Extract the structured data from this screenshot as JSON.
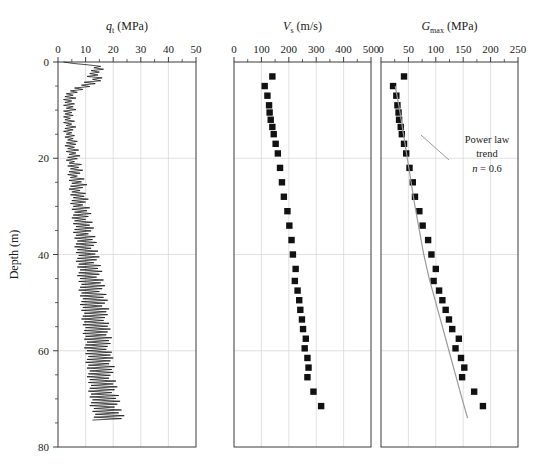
{
  "figure": {
    "ylabel": "Depth (m)",
    "y_ticks": [
      0,
      20,
      40,
      60,
      80
    ],
    "y_minor_step": 5,
    "ylim": [
      0,
      80
    ],
    "background": "#ffffff",
    "grid_color": "#d9d9d9",
    "axis_color": "#3a3a3a",
    "marker_color": "#111111",
    "trend_color": "#9a9a9a"
  },
  "chart_data": [
    {
      "type": "line",
      "panel": 1,
      "title": "q_t (MPa)",
      "title_main": "q",
      "title_sub": "t",
      "title_units": "(MPa)",
      "xlabel": "q_t (MPa)",
      "ylabel": "Depth (m)",
      "xlim": [
        0,
        50
      ],
      "ylim": [
        0,
        80
      ],
      "x_ticks": [
        0,
        10,
        20,
        30,
        40,
        50
      ],
      "x_minor_step": 5,
      "grid": true,
      "legend": "none",
      "series": [
        {
          "name": "Cone tip resistance qt",
          "comment": "depth (m) vs qt (MPa), densely sampled CPT trace",
          "depth": [
            0.0,
            0.3,
            0.6,
            0.9,
            1.2,
            1.5,
            1.8,
            2.1,
            2.4,
            2.7,
            3.0,
            3.3,
            3.6,
            3.9,
            4.2,
            4.5,
            4.8,
            5.1,
            5.4,
            5.7,
            6.0,
            6.3,
            6.6,
            6.9,
            7.2,
            7.5,
            7.8,
            8.1,
            8.4,
            8.7,
            9.0,
            9.3,
            9.6,
            9.9,
            10.2,
            10.5,
            10.8,
            11.1,
            11.4,
            11.7,
            12.0,
            12.3,
            12.6,
            12.9,
            13.2,
            13.5,
            13.8,
            14.1,
            14.4,
            14.7,
            15.0,
            15.3,
            15.6,
            15.9,
            16.2,
            16.5,
            16.8,
            17.1,
            17.4,
            17.7,
            18.0,
            18.3,
            18.6,
            18.9,
            19.2,
            19.5,
            19.8,
            20.1,
            20.4,
            20.7,
            21.0,
            21.3,
            21.6,
            21.9,
            22.2,
            22.5,
            22.8,
            23.1,
            23.4,
            23.7,
            24.0,
            24.3,
            24.6,
            24.9,
            25.2,
            25.5,
            25.8,
            26.1,
            26.4,
            26.7,
            27.0,
            27.3,
            27.6,
            27.9,
            28.2,
            28.5,
            28.8,
            29.1,
            29.4,
            29.7,
            30.0,
            30.3,
            30.6,
            30.9,
            31.2,
            31.5,
            31.8,
            32.1,
            32.4,
            32.7,
            33.0,
            33.3,
            33.6,
            33.9,
            34.2,
            34.5,
            34.8,
            35.1,
            35.4,
            35.7,
            36.0,
            36.3,
            36.6,
            36.9,
            37.2,
            37.5,
            37.8,
            38.1,
            38.4,
            38.7,
            39.0,
            39.3,
            39.6,
            39.9,
            40.2,
            40.5,
            40.8,
            41.1,
            41.4,
            41.7,
            42.0,
            42.3,
            42.6,
            42.9,
            43.2,
            43.5,
            43.8,
            44.1,
            44.4,
            44.7,
            45.0,
            45.3,
            45.6,
            45.9,
            46.2,
            46.5,
            46.8,
            47.1,
            47.4,
            47.7,
            48.0,
            48.3,
            48.6,
            48.9,
            49.2,
            49.5,
            49.8,
            50.1,
            50.4,
            50.7,
            51.0,
            51.3,
            51.6,
            51.9,
            52.2,
            52.5,
            52.8,
            53.1,
            53.4,
            53.7,
            54.0,
            54.3,
            54.6,
            54.9,
            55.2,
            55.5,
            55.8,
            56.1,
            56.4,
            56.7,
            57.0,
            57.3,
            57.6,
            57.9,
            58.2,
            58.5,
            58.8,
            59.1,
            59.4,
            59.7,
            60.0,
            60.3,
            60.6,
            60.9,
            61.2,
            61.5,
            61.8,
            62.1,
            62.4,
            62.7,
            63.0,
            63.3,
            63.6,
            63.9,
            64.2,
            64.5,
            64.8,
            65.1,
            65.4,
            65.7,
            66.0,
            66.3,
            66.6,
            66.9,
            67.2,
            67.5,
            67.8,
            68.1,
            68.4,
            68.7,
            69.0,
            69.3,
            69.6,
            69.9,
            70.2,
            70.5,
            70.8,
            71.1,
            71.4,
            71.7,
            72.0,
            72.3,
            72.6,
            72.9,
            73.2,
            73.5,
            73.8,
            74.1,
            74.4
          ],
          "qt": [
            2.0,
            5.5,
            11.0,
            15.5,
            13.0,
            16.5,
            12.0,
            15.0,
            11.5,
            14.5,
            10.5,
            16.0,
            12.5,
            15.5,
            9.5,
            13.5,
            8.5,
            11.5,
            6.0,
            9.0,
            4.5,
            7.0,
            3.0,
            5.5,
            2.5,
            6.5,
            2.0,
            5.0,
            2.5,
            6.0,
            2.0,
            5.5,
            3.0,
            6.5,
            2.0,
            5.0,
            2.5,
            5.5,
            2.0,
            4.5,
            2.5,
            6.0,
            2.0,
            5.0,
            3.0,
            6.5,
            2.5,
            5.5,
            2.0,
            5.0,
            3.0,
            6.0,
            2.5,
            5.5,
            3.5,
            7.0,
            3.0,
            6.5,
            2.5,
            6.0,
            3.5,
            7.5,
            3.0,
            6.5,
            4.0,
            8.0,
            3.5,
            7.0,
            3.0,
            6.0,
            4.0,
            8.5,
            3.5,
            7.5,
            4.5,
            9.0,
            4.0,
            8.0,
            3.5,
            7.0,
            4.5,
            9.5,
            4.0,
            8.5,
            5.0,
            10.5,
            4.5,
            9.0,
            4.0,
            8.0,
            5.0,
            10.0,
            4.5,
            9.5,
            5.5,
            11.0,
            5.0,
            10.0,
            4.5,
            9.0,
            5.5,
            11.5,
            5.0,
            10.5,
            6.0,
            12.0,
            5.5,
            11.0,
            5.0,
            10.0,
            6.0,
            12.5,
            5.5,
            11.5,
            6.5,
            13.0,
            6.0,
            12.0,
            5.5,
            11.0,
            6.5,
            13.5,
            6.0,
            12.5,
            7.0,
            14.0,
            6.5,
            13.0,
            6.0,
            12.0,
            7.0,
            14.5,
            6.5,
            13.5,
            7.5,
            15.0,
            7.0,
            14.0,
            6.5,
            13.0,
            7.5,
            15.5,
            7.0,
            14.5,
            8.0,
            16.0,
            7.5,
            15.0,
            7.0,
            14.0,
            8.0,
            16.5,
            7.5,
            15.5,
            8.5,
            17.0,
            8.0,
            16.0,
            7.5,
            15.0,
            8.5,
            17.5,
            8.0,
            16.5,
            9.0,
            18.0,
            8.5,
            17.0,
            8.0,
            16.0,
            9.0,
            18.5,
            8.5,
            17.5,
            9.5,
            18.0,
            9.0,
            17.0,
            8.5,
            16.5,
            9.5,
            18.5,
            9.0,
            18.0,
            10.0,
            19.0,
            9.5,
            18.0,
            9.0,
            17.5,
            10.0,
            19.5,
            9.5,
            18.5,
            10.5,
            19.0,
            10.0,
            18.0,
            9.5,
            17.5,
            10.5,
            19.5,
            10.0,
            19.0,
            11.0,
            20.0,
            10.5,
            19.0,
            10.0,
            18.5,
            11.0,
            20.5,
            10.5,
            19.5,
            11.5,
            20.0,
            11.0,
            19.0,
            10.5,
            18.5,
            11.5,
            21.0,
            11.0,
            20.0,
            12.0,
            21.5,
            11.5,
            20.5,
            11.0,
            19.5,
            12.0,
            22.0,
            11.5,
            21.0,
            12.5,
            22.5,
            12.0,
            21.5,
            11.5,
            20.5,
            13.0,
            23.0,
            12.5,
            22.0,
            13.5,
            24.0,
            13.0,
            23.0,
            12.5,
            22.5,
            14.0,
            25.0
          ]
        }
      ]
    },
    {
      "type": "scatter",
      "panel": 2,
      "title": "V_s (m/s)",
      "title_main": "V",
      "title_sub": "s",
      "title_units": "(m/s)",
      "xlabel": "V_s (m/s)",
      "ylabel": "Depth (m)",
      "xlim": [
        0,
        500
      ],
      "ylim": [
        0,
        80
      ],
      "x_ticks": [
        0,
        100,
        200,
        300,
        400,
        500
      ],
      "x_minor_step": 50,
      "grid": true,
      "marker": "square",
      "legend": "none",
      "series": [
        {
          "name": "Shear wave velocity Vs",
          "comment": "depth (m) vs Vs (m/s), discrete seismic CPT intervals",
          "points": [
            [
              3.0,
              140
            ],
            [
              5.0,
              112
            ],
            [
              7.0,
              122
            ],
            [
              9.0,
              128
            ],
            [
              10.5,
              130
            ],
            [
              12.0,
              134
            ],
            [
              13.5,
              140
            ],
            [
              15.0,
              145
            ],
            [
              17.0,
              152
            ],
            [
              19.0,
              160
            ],
            [
              22.0,
              168
            ],
            [
              25.0,
              175
            ],
            [
              28.0,
              182
            ],
            [
              31.0,
              195
            ],
            [
              34.0,
              202
            ],
            [
              37.0,
              210
            ],
            [
              40.0,
              215
            ],
            [
              43.0,
              225
            ],
            [
              45.5,
              222
            ],
            [
              47.5,
              232
            ],
            [
              49.5,
              238
            ],
            [
              51.5,
              242
            ],
            [
              53.5,
              248
            ],
            [
              55.5,
              252
            ],
            [
              57.5,
              262
            ],
            [
              59.5,
              258
            ],
            [
              61.5,
              268
            ],
            [
              63.5,
              272
            ],
            [
              65.5,
              268
            ],
            [
              68.5,
              290
            ],
            [
              71.5,
              318
            ]
          ]
        }
      ]
    },
    {
      "type": "scatter",
      "panel": 3,
      "title": "G_max (MPa)",
      "title_main": "G",
      "title_sub": "max",
      "title_units": "(MPa)",
      "xlabel": "G_max (MPa)",
      "ylabel": "Depth (m)",
      "xlim": [
        0,
        250
      ],
      "ylim": [
        0,
        80
      ],
      "x_ticks": [
        0,
        50,
        100,
        150,
        200,
        250
      ],
      "x_minor_step": 25,
      "grid": true,
      "marker": "square",
      "legend": "none",
      "annotation": {
        "line1": "Power law",
        "line2": "trend",
        "line3_var": "n",
        "line3_val": "= 0.6",
        "exponent": 0.6
      },
      "series": [
        {
          "name": "Small-strain shear modulus Gmax",
          "comment": "depth (m) vs Gmax (MPa), square markers",
          "points": [
            [
              3.0,
              42
            ],
            [
              5.0,
              22
            ],
            [
              7.0,
              28
            ],
            [
              9.0,
              30
            ],
            [
              10.5,
              32
            ],
            [
              12.0,
              33
            ],
            [
              13.5,
              36
            ],
            [
              15.0,
              38
            ],
            [
              17.0,
              42
            ],
            [
              19.0,
              46
            ],
            [
              22.0,
              52
            ],
            [
              25.0,
              58
            ],
            [
              28.0,
              62
            ],
            [
              31.0,
              70
            ],
            [
              34.0,
              76
            ],
            [
              37.0,
              86
            ],
            [
              40.0,
              92
            ],
            [
              43.0,
              100
            ],
            [
              45.5,
              96
            ],
            [
              47.5,
              106
            ],
            [
              49.5,
              112
            ],
            [
              51.5,
              118
            ],
            [
              53.5,
              124
            ],
            [
              55.5,
              130
            ],
            [
              57.5,
              142
            ],
            [
              59.5,
              136
            ],
            [
              61.5,
              146
            ],
            [
              63.5,
              152
            ],
            [
              65.5,
              148
            ],
            [
              68.5,
              170
            ],
            [
              71.5,
              186
            ]
          ]
        },
        {
          "name": "Power law trend line",
          "comment": "Gmax = A * z^0.6 reference trend, depth-Gmax pairs",
          "trend": [
            [
              5.0,
              26
            ],
            [
              10.0,
              34
            ],
            [
              15.0,
              41
            ],
            [
              20.0,
              48
            ],
            [
              25.0,
              55
            ],
            [
              30.0,
              62
            ],
            [
              35.0,
              70
            ],
            [
              40.0,
              78
            ],
            [
              45.0,
              88
            ],
            [
              50.0,
              100
            ],
            [
              55.0,
              112
            ],
            [
              60.0,
              124
            ],
            [
              65.0,
              136
            ],
            [
              70.0,
              148
            ],
            [
              74.0,
              158
            ]
          ]
        }
      ]
    }
  ]
}
